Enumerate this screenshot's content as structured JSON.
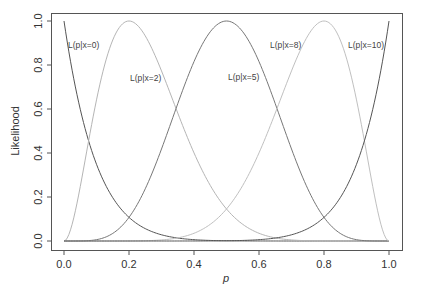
{
  "chart_data": {
    "type": "line",
    "title": "",
    "xlabel": "p",
    "ylabel": "Likelihood",
    "xlim": [
      0.0,
      1.0
    ],
    "ylim": [
      0.0,
      1.0
    ],
    "grid": false,
    "legend": "none (curves labeled inline)",
    "x_ticks": [
      "0.0",
      "0.2",
      "0.4",
      "0.6",
      "0.8",
      "1.0"
    ],
    "y_ticks": [
      "0.0",
      "0.2",
      "0.4",
      "0.6",
      "0.8",
      "1.0"
    ],
    "x": [
      0.0,
      0.1,
      0.2,
      0.3,
      0.4,
      0.5,
      0.6,
      0.7,
      0.8,
      0.9,
      1.0
    ],
    "series": [
      {
        "name": "L(p|x=0)",
        "x_successes": 0,
        "n": 10,
        "color": "#555555",
        "values": [
          1.0,
          0.349,
          0.107,
          0.028,
          0.006,
          0.001,
          0.0,
          0.0,
          0.0,
          0.0,
          0.0
        ]
      },
      {
        "name": "L(p|x=2)",
        "x_successes": 2,
        "n": 10,
        "color": "#b5b5b5",
        "values": [
          0.0,
          0.641,
          1.0,
          0.773,
          0.4,
          0.146,
          0.035,
          0.005,
          0.0,
          0.0,
          0.0
        ]
      },
      {
        "name": "L(p|x=5)",
        "x_successes": 5,
        "n": 10,
        "color": "#777777",
        "values": [
          0.0,
          0.006,
          0.107,
          0.418,
          0.815,
          1.0,
          0.815,
          0.418,
          0.107,
          0.006,
          0.0
        ]
      },
      {
        "name": "L(p|x=8)",
        "x_successes": 8,
        "n": 10,
        "color": "#c0c0c0",
        "values": [
          0.0,
          0.0,
          0.0,
          0.005,
          0.035,
          0.146,
          0.4,
          0.773,
          1.0,
          0.641,
          0.0
        ]
      },
      {
        "name": "L(p|x=10)",
        "x_successes": 10,
        "n": 10,
        "color": "#555555",
        "values": [
          0.0,
          0.0,
          0.0,
          0.0,
          0.0,
          0.001,
          0.006,
          0.028,
          0.107,
          0.349,
          1.0
        ]
      }
    ],
    "annotations": [
      {
        "text": "L(p|x=0)",
        "x": 68,
        "y": 48
      },
      {
        "text": "L(p|x=2)",
        "x": 130,
        "y": 81
      },
      {
        "text": "L(p|x=5)",
        "x": 228,
        "y": 80
      },
      {
        "text": "L(p|x=8)",
        "x": 270,
        "y": 48
      },
      {
        "text": "L(p|x=10)",
        "x": 348,
        "y": 48
      }
    ]
  }
}
